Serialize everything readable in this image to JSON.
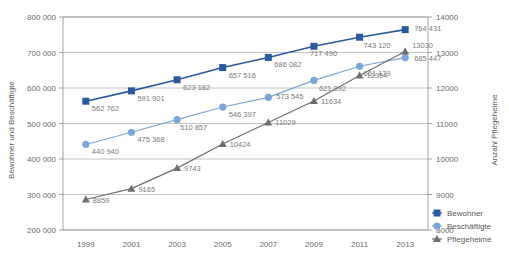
{
  "chart_data": {
    "type": "line",
    "title": "",
    "x": [
      1999,
      2001,
      2003,
      2005,
      2007,
      2009,
      2011,
      2013
    ],
    "categories": [
      "1999",
      "2001",
      "2003",
      "2005",
      "2007",
      "2009",
      "2011",
      "2013"
    ],
    "series": [
      {
        "name": "Bewohner",
        "axis": "left",
        "color": "#2a5a9c",
        "marker": "square",
        "values": [
          562762,
          591901,
          623182,
          657516,
          686082,
          717490,
          743120,
          764431
        ],
        "labels": [
          "562 762",
          "591 901",
          "623 182",
          "657 516",
          "686 082",
          "717 490",
          "743 120",
          "764 431"
        ]
      },
      {
        "name": "Beschäftigte",
        "axis": "left",
        "color": "#7ba7d7",
        "marker": "circle",
        "values": [
          440940,
          475368,
          510857,
          546397,
          573545,
          621392,
          661179,
          685447
        ],
        "labels": [
          "440 940",
          "475 368",
          "510 857",
          "546 397",
          "573 545",
          "621 392",
          "661 179",
          "685 447"
        ]
      },
      {
        "name": "Pflegeheime",
        "axis": "right",
        "color": "#6e6e6e",
        "marker": "triangle",
        "values": [
          8859,
          9165,
          9743,
          10424,
          11029,
          11634,
          12354,
          13030
        ],
        "labels": [
          "8859",
          "9165",
          "9743",
          "10424",
          "11029",
          "11634",
          "12354",
          "13030"
        ]
      }
    ],
    "left_axis": {
      "label": "Bewohner und Beschäftigte",
      "min": 200000,
      "max": 800000,
      "ticks": [
        200000,
        300000,
        400000,
        500000,
        600000,
        700000,
        800000
      ],
      "ticklabels": [
        "200 000",
        "300 000",
        "400 000",
        "500 000",
        "600 000",
        "700 000",
        "800 000"
      ]
    },
    "right_axis": {
      "label": "Anzahl Pflegeheime",
      "min": 8000,
      "max": 14000,
      "ticks": [
        8000,
        9000,
        10000,
        11000,
        12000,
        13000,
        14000
      ],
      "ticklabels": [
        "8000",
        "9000",
        "10000",
        "11000",
        "12000",
        "13000",
        "14000"
      ]
    },
    "xlabel": "",
    "grid": true,
    "legend_position": "right-bottom",
    "legend": [
      {
        "label": "Bewohner",
        "color": "#2a5a9c",
        "marker": "square"
      },
      {
        "label": "Beschäftigte",
        "color": "#7ba7d7",
        "marker": "circle"
      },
      {
        "label": "Pflegeheime",
        "color": "#6e6e6e",
        "marker": "triangle"
      }
    ]
  },
  "label_offsets": {
    "Bewohner": [
      [
        6,
        10
      ],
      [
        6,
        10
      ],
      [
        6,
        10
      ],
      [
        6,
        10
      ],
      [
        6,
        10
      ],
      [
        -4,
        10
      ],
      [
        4,
        11
      ],
      [
        9,
        1
      ]
    ],
    "Beschäftigte": [
      [
        6,
        10
      ],
      [
        6,
        10
      ],
      [
        3,
        10
      ],
      [
        6,
        10
      ],
      [
        8,
        2
      ],
      [
        5,
        11
      ],
      [
        4,
        10
      ],
      [
        9,
        3
      ]
    ],
    "Pflegeheime": [
      [
        7,
        3
      ],
      [
        7,
        3
      ],
      [
        7,
        3
      ],
      [
        7,
        3
      ],
      [
        7,
        3
      ],
      [
        7,
        3
      ],
      [
        7,
        3
      ],
      [
        7,
        -3
      ]
    ]
  }
}
